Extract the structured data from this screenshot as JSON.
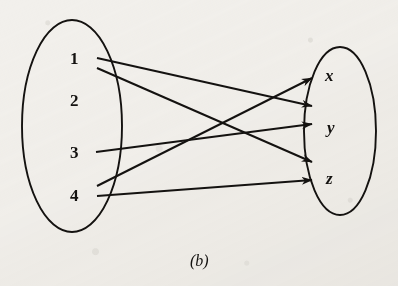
{
  "figure": {
    "caption": "(b)",
    "background_color": "#f2f0ec",
    "ink_color": "#141210",
    "width": 398,
    "height": 286
  },
  "domain_set": {
    "name": "left-set",
    "ellipse": {
      "cx": 72,
      "cy": 126,
      "rx": 50,
      "ry": 106
    },
    "elements": [
      {
        "label": "1",
        "x": 70,
        "y": 58,
        "anchor_x": 95,
        "anchor_y": 61
      },
      {
        "label": "2",
        "x": 70,
        "y": 100,
        "anchor_x": 95,
        "anchor_y": 100
      },
      {
        "label": "3",
        "x": 70,
        "y": 152,
        "anchor_x": 95,
        "anchor_y": 152
      },
      {
        "label": "4",
        "x": 70,
        "y": 195,
        "anchor_x": 95,
        "anchor_y": 192
      }
    ]
  },
  "codomain_set": {
    "name": "right-set",
    "ellipse": {
      "cx": 340,
      "cy": 131,
      "rx": 36,
      "ry": 84
    },
    "elements": [
      {
        "label": "x",
        "x": 325,
        "y": 75
      },
      {
        "label": "y",
        "x": 328,
        "y": 127
      },
      {
        "label": "z",
        "x": 327,
        "y": 178
      }
    ]
  },
  "arrows": [
    {
      "from": "1",
      "to": "y",
      "x1": 97,
      "y1": 58,
      "x2": 312,
      "y2": 106
    },
    {
      "from": "1",
      "to": "z",
      "x1": 97,
      "y1": 68,
      "x2": 312,
      "y2": 162
    },
    {
      "from": "3",
      "to": "y",
      "x1": 96,
      "y1": 152,
      "x2": 312,
      "y2": 124
    },
    {
      "from": "4",
      "to": "x",
      "x1": 97,
      "y1": 186,
      "x2": 312,
      "y2": 78
    },
    {
      "from": "4",
      "to": "z",
      "x1": 97,
      "y1": 196,
      "x2": 312,
      "y2": 180
    }
  ],
  "pairs_text": [
    "(1, y)",
    "(1, z)",
    "(3, y)",
    "(4, x)",
    "(4, z)"
  ],
  "chart_data": {
    "type": "diagram",
    "subtype": "bipartite-arrow-diagram",
    "title": "(b)",
    "domain": [
      "1",
      "2",
      "3",
      "4"
    ],
    "codomain": [
      "x",
      "y",
      "z"
    ],
    "edges": [
      {
        "source": "1",
        "target": "y"
      },
      {
        "source": "1",
        "target": "z"
      },
      {
        "source": "3",
        "target": "y"
      },
      {
        "source": "4",
        "target": "x"
      },
      {
        "source": "4",
        "target": "z"
      }
    ],
    "unmapped_domain_elements": [
      "2"
    ],
    "unmapped_codomain_elements": [],
    "edge_count": 5,
    "is_function": false
  }
}
